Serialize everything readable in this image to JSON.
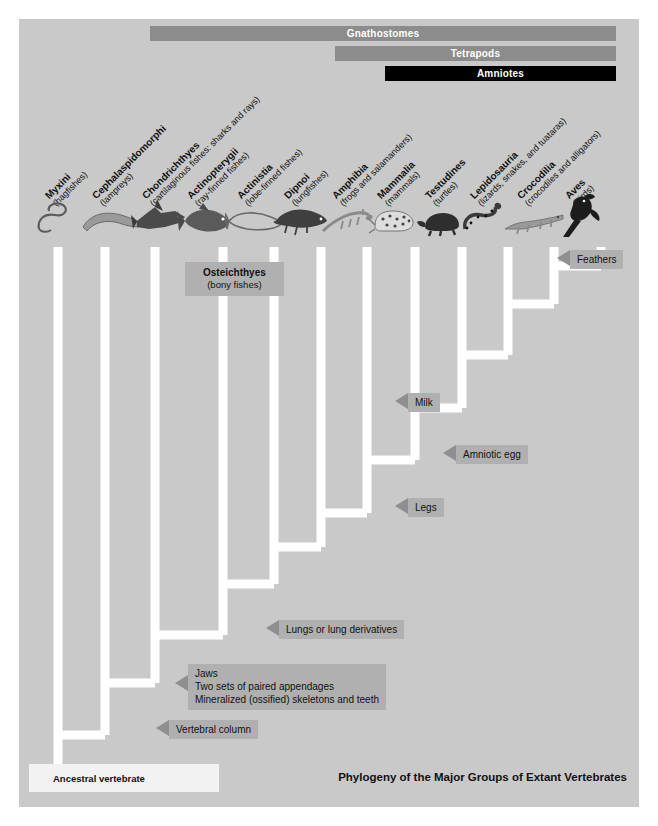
{
  "figure": {
    "title": "Phylogeny of the Major Groups of Extant Vertebrates",
    "background_color": "#c9c9c9",
    "branch_color": "#ffffff",
    "annotation_box_color": "#b0b0b0",
    "root_label": "Ancestral vertebrate"
  },
  "clade_bars": [
    {
      "label": "Gnathostomes",
      "style": "grey",
      "x": 131,
      "y": 7,
      "width": 466
    },
    {
      "label": "Tetrapods",
      "style": "grey",
      "x": 316,
      "y": 27,
      "width": 281
    },
    {
      "label": "Amniotes",
      "style": "black",
      "x": 366,
      "y": 47,
      "width": 231
    }
  ],
  "taxa": [
    {
      "name": "Myxini",
      "common": "(hagfishes)",
      "tip_x": 39,
      "icon": "hagfish-silhouette"
    },
    {
      "name": "Cephalaspidomorphi",
      "common": "(lampreys)",
      "tip_x": 86,
      "icon": "lamprey-silhouette"
    },
    {
      "name": "Chondrichthyes",
      "common": "(cartilaginous fishes: sharks and rays)",
      "tip_x": 136,
      "icon": "shark-silhouette"
    },
    {
      "name": "Actinopterygii",
      "common": "(ray-finned fishes)",
      "tip_x": 181,
      "icon": "rayfinned-fish-silhouette"
    },
    {
      "name": "Actinistia",
      "common": "(lobe-finned fishes)",
      "tip_x": 231,
      "icon": "coelacanth-silhouette"
    },
    {
      "name": "Dipnoi",
      "common": "(lungfishes)",
      "tip_x": 278,
      "icon": "lungfish-silhouette"
    },
    {
      "name": "Amphibia",
      "common": "(frogs and salamanders)",
      "tip_x": 326,
      "icon": "salamander-silhouette"
    },
    {
      "name": "Mammalia",
      "common": "(mammals)",
      "tip_x": 371,
      "icon": "leopard-silhouette"
    },
    {
      "name": "Testudines",
      "common": "(turtles)",
      "tip_x": 419,
      "icon": "turtle-silhouette"
    },
    {
      "name": "Lepidosauria",
      "common": "(lizards, snakes, and tuataras)",
      "tip_x": 464,
      "icon": "snake-silhouette"
    },
    {
      "name": "Crocodilia",
      "common": "(crocodiles and alligators)",
      "tip_x": 511,
      "icon": "crocodile-silhouette"
    },
    {
      "name": "Aves",
      "common": "(birds)",
      "tip_x": 559,
      "icon": "bird-silhouette"
    }
  ],
  "clade_callouts": [
    {
      "name": "Osteichthyes",
      "common": "(bony fishes)",
      "x": 166,
      "y": 243
    }
  ],
  "trait_annotations": [
    {
      "label": "Feathers",
      "lines": [
        "Feathers"
      ],
      "x": 551,
      "y": 235
    },
    {
      "label": "Milk",
      "lines": [
        "Milk"
      ],
      "x": 389,
      "y": 378
    },
    {
      "label": "Amniotic egg",
      "lines": [
        "Amniotic egg"
      ],
      "x": 437,
      "y": 430
    },
    {
      "label": "Legs",
      "lines": [
        "Legs"
      ],
      "x": 389,
      "y": 483
    },
    {
      "label": "Lungs or lung derivatives",
      "lines": [
        "Lungs or lung derivatives"
      ],
      "x": 260,
      "y": 605
    },
    {
      "label": "Jaws",
      "lines": [
        "Jaws",
        "Two sets of paired appendages",
        "Mineralized (ossified) skeletons and teeth"
      ],
      "x": 169,
      "y": 651
    },
    {
      "label": "Vertebral column",
      "lines": [
        "Vertebral column"
      ],
      "x": 150,
      "y": 705
    }
  ]
}
